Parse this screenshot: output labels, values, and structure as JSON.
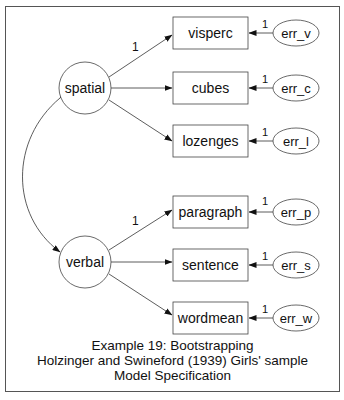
{
  "latent": [
    {
      "id": "spatial",
      "label": "spatial"
    },
    {
      "id": "verbal",
      "label": "verbal"
    }
  ],
  "observed": [
    {
      "label": "visperc",
      "loading": "1"
    },
    {
      "label": "cubes",
      "loading": ""
    },
    {
      "label": "lozenges",
      "loading": ""
    },
    {
      "label": "paragraph",
      "loading": "1"
    },
    {
      "label": "sentence",
      "loading": ""
    },
    {
      "label": "wordmean",
      "loading": ""
    }
  ],
  "errors": [
    {
      "label": "err_v",
      "weight": "1"
    },
    {
      "label": "err_c",
      "weight": "1"
    },
    {
      "label": "err_l",
      "weight": "1"
    },
    {
      "label": "err_p",
      "weight": "1"
    },
    {
      "label": "err_s",
      "weight": "1"
    },
    {
      "label": "err_w",
      "weight": "1"
    }
  ],
  "caption": {
    "line1": "Example 19: Bootstrapping",
    "line2": "Holzinger and Swineford (1939) Girls' sample",
    "line3": "Model Specification"
  },
  "colors": {
    "stroke": "#333333",
    "frame": "#555555",
    "background": "#ffffff"
  }
}
